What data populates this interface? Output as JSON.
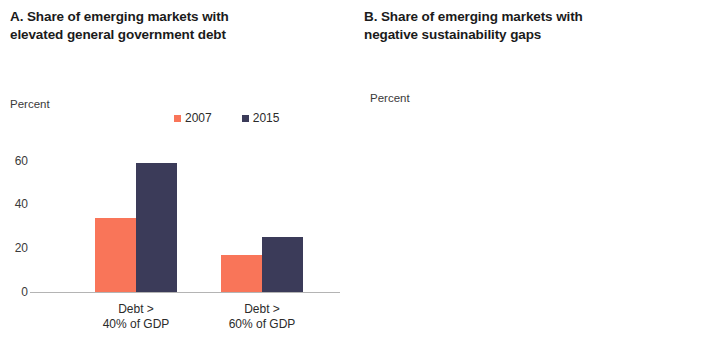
{
  "colors": {
    "navy": "#3b3b59",
    "salmon": "#f97559",
    "amber": "#f7ab4d",
    "axis": "#b4b4b4",
    "text": "#1b1b1b"
  },
  "panel_a": {
    "title": "A. Share of emerging markets with\nelevated general government debt",
    "axis_unit": "Percent",
    "legend": [
      {
        "label": "2007",
        "color": "#f97559"
      },
      {
        "label": "2015",
        "color": "#3b3b59"
      }
    ]
  },
  "panel_b": {
    "title": "B. Share of emerging markets with\nnegative sustainability gaps",
    "axis_unit": "Percent",
    "legend": [
      {
        "label": "2001",
        "color": "#3b3b59"
      },
      {
        "label": "2007",
        "color": "#f97559"
      },
      {
        "label": "2015",
        "color": "#f7ab4d"
      }
    ]
  },
  "chart_data": [
    {
      "id": "panel_a",
      "type": "bar",
      "title": "A. Share of emerging markets with elevated general government debt",
      "xlabel": "",
      "ylabel": "Percent",
      "ylim": [
        0,
        60
      ],
      "yticks": [
        0,
        20,
        40,
        60
      ],
      "ytick_labels": [
        "0",
        "20",
        "40",
        "60"
      ],
      "grid": false,
      "legend_position": "top-right",
      "categories": [
        "Debt >\n40% of GDP",
        "Debt >\n60% of GDP"
      ],
      "series": [
        {
          "name": "2007",
          "color": "#f97559",
          "values": [
            34,
            17
          ]
        },
        {
          "name": "2015",
          "color": "#3b3b59",
          "values": [
            59,
            25
          ]
        }
      ]
    },
    {
      "id": "panel_b",
      "type": "bar",
      "title": "B. Share of emerging markets with negative sustainability gaps",
      "xlabel": "",
      "ylabel": "Percent",
      "ylim": [
        0,
        60
      ],
      "yticks": [
        0,
        10,
        20,
        30,
        40,
        50,
        60
      ],
      "ytick_labels": [
        "0",
        "10",
        "20",
        "30",
        "40",
        "50",
        "60"
      ],
      "grid": false,
      "legend_position": "top-right",
      "categories": [
        "2001",
        "2007",
        "2015"
      ],
      "values": [
        52,
        16,
        46
      ],
      "colors": [
        "#3b3b59",
        "#f97559",
        "#f7ab4d"
      ],
      "series": [
        {
          "name": "2001",
          "color": "#3b3b59",
          "values": [
            52
          ]
        },
        {
          "name": "2007",
          "color": "#f97559",
          "values": [
            16
          ]
        },
        {
          "name": "2015",
          "color": "#f7ab4d",
          "values": [
            46
          ]
        }
      ]
    }
  ]
}
